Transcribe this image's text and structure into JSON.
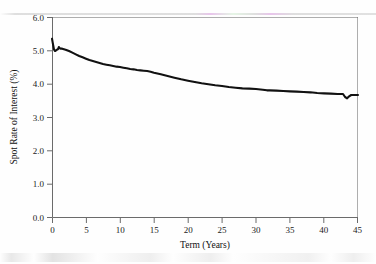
{
  "chart_data": {
    "type": "line",
    "title": "",
    "xlabel": "Term (Years)",
    "ylabel": "Spot Rate of Interest (%)",
    "xlim": [
      0,
      45
    ],
    "ylim": [
      0.0,
      6.0
    ],
    "xticks": [
      0,
      5,
      10,
      15,
      20,
      25,
      30,
      35,
      40,
      45
    ],
    "xtick_labels": [
      "0",
      "5",
      "10",
      "15",
      "20",
      "25",
      "30",
      "35",
      "40",
      "45"
    ],
    "yticks": [
      0.0,
      1.0,
      2.0,
      3.0,
      4.0,
      5.0,
      6.0
    ],
    "ytick_labels": [
      "0.0",
      "1.0",
      "2.0",
      "3.0",
      "4.0",
      "5.0",
      "6.0"
    ],
    "grid": false,
    "legend": null,
    "line_color": "#111111",
    "axis_color": "#6b6b6b",
    "series": [
      {
        "name": "Spot Rate of Interest",
        "x": [
          0.0,
          0.15,
          0.3,
          0.45,
          0.6,
          0.75,
          0.9,
          1.0,
          1.15,
          1.3,
          1.5,
          2.0,
          2.5,
          3.0,
          3.5,
          4.0,
          4.5,
          5.0,
          5.5,
          6.0,
          6.5,
          7.0,
          7.5,
          8.0,
          8.5,
          9.0,
          9.5,
          10.0,
          10.5,
          11.0,
          11.5,
          12.0,
          12.5,
          13.0,
          13.5,
          14.0,
          14.5,
          15.0,
          16.0,
          17.0,
          18.0,
          19.0,
          20.0,
          21.0,
          22.0,
          23.0,
          24.0,
          25.0,
          26.0,
          27.0,
          28.0,
          29.0,
          30.0,
          31.0,
          31.6,
          32.0,
          33.0,
          34.0,
          35.0,
          36.0,
          37.0,
          38.0,
          39.0,
          40.0,
          41.0,
          42.0,
          42.8,
          43.1,
          43.4,
          43.7,
          44.0,
          44.4,
          45.0
        ],
        "y": [
          5.35,
          5.18,
          5.02,
          4.98,
          5.0,
          5.02,
          5.04,
          5.1,
          5.06,
          5.05,
          5.05,
          5.02,
          4.98,
          4.93,
          4.88,
          4.83,
          4.79,
          4.75,
          4.71,
          4.68,
          4.65,
          4.62,
          4.59,
          4.57,
          4.55,
          4.53,
          4.51,
          4.5,
          4.48,
          4.46,
          4.44,
          4.43,
          4.41,
          4.4,
          4.39,
          4.38,
          4.36,
          4.33,
          4.28,
          4.23,
          4.18,
          4.13,
          4.09,
          4.05,
          4.01,
          3.98,
          3.95,
          3.93,
          3.9,
          3.88,
          3.86,
          3.85,
          3.84,
          3.82,
          3.8,
          3.8,
          3.79,
          3.78,
          3.77,
          3.76,
          3.75,
          3.74,
          3.72,
          3.71,
          3.7,
          3.69,
          3.69,
          3.6,
          3.56,
          3.62,
          3.66,
          3.66,
          3.66
        ],
        "notes": "Downward-sloping spot rate curve: initial spike to 5.35% at term 0, dip to 4.98% near 0.45y, local bump to 5.10% near 1y, smooth monotone decay to about 3.69% by 42y, a sharp downward notch to 3.56% near 43.4y, recovering to 3.66% at 45y."
      }
    ]
  },
  "figure": {
    "background_color": "#ffffff",
    "plot_area": {
      "left_px": 52,
      "top_px": 17,
      "right_px": 358,
      "bottom_px": 217
    }
  }
}
